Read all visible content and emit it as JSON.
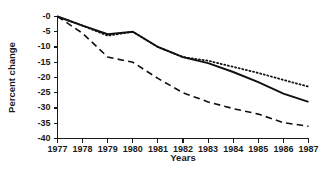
{
  "chart_data": {
    "type": "line",
    "title": "",
    "xlabel": "Years",
    "ylabel": "Percent change",
    "x": [
      1977,
      1978,
      1979,
      1980,
      1981,
      1982,
      1983,
      1984,
      1985,
      1986,
      1987
    ],
    "xticklabels": [
      "1977",
      "1978",
      "1979",
      "1980",
      "1981",
      "1982",
      "1983",
      "1984",
      "1985",
      "1986",
      "1987"
    ],
    "yticklabels": [
      "-0",
      "-5",
      "-10",
      "-15",
      "-20",
      "-25",
      "-30",
      "-35",
      "-40"
    ],
    "yticks": [
      0,
      -5,
      -10,
      -15,
      -20,
      -25,
      -30,
      -35,
      -40
    ],
    "ylim": [
      -40,
      0
    ],
    "xlim": [
      1977,
      1987
    ],
    "grid": false,
    "legend": "none",
    "series": [
      {
        "name": "solid-series",
        "style": "solid",
        "color": "#111111",
        "values": [
          0,
          -3.0,
          -5.8,
          -5.0,
          -10.0,
          -13.3,
          -15.3,
          -18.2,
          -21.5,
          -25.3,
          -28.0
        ]
      },
      {
        "name": "dotted-series",
        "style": "dotted",
        "color": "#111111",
        "values": [
          0,
          -3.0,
          -6.3,
          -5.0,
          -10.0,
          -13.3,
          -14.5,
          -16.5,
          -18.5,
          -20.8,
          -23.0
        ]
      },
      {
        "name": "dashed-series",
        "style": "dashed",
        "color": "#111111",
        "values": [
          0,
          -5.5,
          -13.3,
          -15.0,
          -20.3,
          -25.0,
          -28.0,
          -30.2,
          -32.0,
          -34.8,
          -36.0
        ]
      }
    ]
  }
}
